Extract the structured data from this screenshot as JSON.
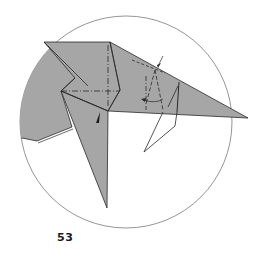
{
  "diagram": {
    "step_number": "53",
    "colors": {
      "paper_fill": "#a6a6a6",
      "line": "#2a2a2a",
      "circle": "#7a7a7a",
      "background": "#ffffff"
    },
    "symbols": {
      "push_arrow": "sink-arrow-icon",
      "fold_arrow": "fold-direction-arrow",
      "mountain_fold": "dash-dot line",
      "valley_fold": "dashed line"
    }
  }
}
